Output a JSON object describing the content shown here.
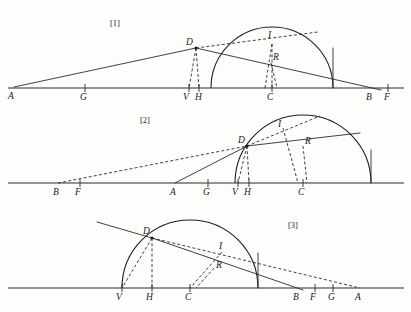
{
  "document": {
    "title": "Three refraction construction diagrams",
    "background_color": "#fdfdfb",
    "ink_color": "#2b2b2b"
  },
  "figures": [
    {
      "id": "figure-1",
      "caption": "[1]",
      "caption_x": 110,
      "caption_y": 26,
      "baseline": {
        "x1": 8,
        "y1": 88,
        "x2": 404,
        "y2": 88
      },
      "arc": {
        "cx": 272,
        "cy": 88,
        "r": 61,
        "start_deg": 180,
        "end_deg": 0
      },
      "points": [
        {
          "label": "A",
          "x": 14,
          "y": 87,
          "lx": 8,
          "ly": 99,
          "tick": false,
          "dot": false
        },
        {
          "label": "G",
          "x": 85,
          "y": 88,
          "lx": 80,
          "ly": 100,
          "tick": true,
          "dot": false
        },
        {
          "label": "V",
          "x": 189,
          "y": 88,
          "lx": 183,
          "ly": 100,
          "tick": true,
          "dot": false
        },
        {
          "label": "H",
          "x": 199,
          "y": 88,
          "lx": 195,
          "ly": 100,
          "tick": true,
          "dot": false
        },
        {
          "label": "C",
          "x": 272,
          "y": 88,
          "lx": 267,
          "ly": 100,
          "tick": true,
          "dot": false
        },
        {
          "label": "B",
          "x": 372,
          "y": 88,
          "lx": 366,
          "ly": 100,
          "tick": false,
          "dot": false
        },
        {
          "label": "F",
          "x": 388,
          "y": 88,
          "lx": 384,
          "ly": 100,
          "tick": true,
          "dot": false
        },
        {
          "label": "D",
          "x": 196,
          "y": 48,
          "lx": 186,
          "ly": 45,
          "tick": false,
          "dot": true
        },
        {
          "label": "I",
          "x": 272,
          "y": 44,
          "lx": 268,
          "ly": 38,
          "tick": false,
          "dot": false
        },
        {
          "label": "R",
          "x": 271,
          "y": 63,
          "lx": 273,
          "ly": 60,
          "tick": false,
          "dot": false
        }
      ],
      "solid_segments": [
        {
          "name": "incident-ray-A-D",
          "x1": 14,
          "y1": 87,
          "x2": 196,
          "y2": 48
        },
        {
          "name": "refracted-ray-D-B",
          "x1": 196,
          "y1": 48,
          "x2": 381,
          "y2": 90
        },
        {
          "name": "vertical-right-edge",
          "x1": 333,
          "y1": 88,
          "x2": 333,
          "y2": 48
        }
      ],
      "dashed_segments": [
        {
          "name": "chord-D-to-upper-right",
          "x1": 196,
          "y1": 48,
          "x2": 318,
          "y2": 32
        },
        {
          "name": "normal-D-to-V",
          "x1": 196,
          "y1": 48,
          "x2": 189,
          "y2": 88
        },
        {
          "name": "perp-D-to-H",
          "x1": 196,
          "y1": 48,
          "x2": 199,
          "y2": 88
        },
        {
          "name": "normal-I-to-C",
          "x1": 272,
          "y1": 44,
          "x2": 272,
          "y2": 88
        },
        {
          "name": "sine-I-drop",
          "x1": 272,
          "y1": 44,
          "x2": 265,
          "y2": 88
        },
        {
          "name": "sine-R-drop",
          "x1": 271,
          "y1": 63,
          "x2": 277,
          "y2": 88
        }
      ]
    },
    {
      "id": "figure-2",
      "caption": "[2]",
      "caption_x": 140,
      "caption_y": 123,
      "baseline": {
        "x1": 8,
        "y1": 183,
        "x2": 404,
        "y2": 183
      },
      "arc": {
        "cx": 303,
        "cy": 183,
        "r": 68,
        "start_deg": 180,
        "end_deg": 0
      },
      "points": [
        {
          "label": "B",
          "x": 58,
          "y": 183,
          "lx": 53,
          "ly": 195,
          "tick": false,
          "dot": false
        },
        {
          "label": "F",
          "x": 80,
          "y": 183,
          "lx": 75,
          "ly": 195,
          "tick": true,
          "dot": false
        },
        {
          "label": "A",
          "x": 175,
          "y": 183,
          "lx": 170,
          "ly": 195,
          "tick": false,
          "dot": false
        },
        {
          "label": "G",
          "x": 208,
          "y": 183,
          "lx": 203,
          "ly": 195,
          "tick": true,
          "dot": false
        },
        {
          "label": "V",
          "x": 238,
          "y": 183,
          "lx": 232,
          "ly": 195,
          "tick": true,
          "dot": false
        },
        {
          "label": "H",
          "x": 249,
          "y": 183,
          "lx": 244,
          "ly": 195,
          "tick": true,
          "dot": false
        },
        {
          "label": "C",
          "x": 303,
          "y": 183,
          "lx": 298,
          "ly": 195,
          "tick": true,
          "dot": false
        },
        {
          "label": "D",
          "x": 247,
          "y": 146,
          "lx": 238,
          "ly": 143,
          "tick": false,
          "dot": true
        },
        {
          "label": "I",
          "x": 283,
          "y": 128,
          "lx": 278,
          "ly": 127,
          "tick": false,
          "dot": false
        },
        {
          "label": "R",
          "x": 303,
          "y": 146,
          "lx": 305,
          "ly": 144,
          "tick": false,
          "dot": false
        }
      ],
      "solid_segments": [
        {
          "name": "incident-ray-A-D",
          "x1": 175,
          "y1": 183,
          "x2": 247,
          "y2": 146
        },
        {
          "name": "refracted-ray-D-right",
          "x1": 247,
          "y1": 146,
          "x2": 360,
          "y2": 133
        },
        {
          "name": "vertical-right-edge",
          "x1": 371,
          "y1": 183,
          "x2": 371,
          "y2": 150
        }
      ],
      "dashed_segments": [
        {
          "name": "extension-B-to-D",
          "x1": 58,
          "y1": 183,
          "x2": 247,
          "y2": 146
        },
        {
          "name": "chord-D-to-apex",
          "x1": 247,
          "y1": 146,
          "x2": 320,
          "y2": 116
        },
        {
          "name": "normal-D-to-V",
          "x1": 247,
          "y1": 146,
          "x2": 238,
          "y2": 183
        },
        {
          "name": "perp-D-to-H",
          "x1": 247,
          "y1": 146,
          "x2": 249,
          "y2": 183
        },
        {
          "name": "normal-I-to-C",
          "x1": 283,
          "y1": 128,
          "x2": 298,
          "y2": 183
        },
        {
          "name": "sine-R-drop",
          "x1": 303,
          "y1": 146,
          "x2": 307,
          "y2": 183
        }
      ]
    },
    {
      "id": "figure-3",
      "caption": "[3]",
      "caption_x": 288,
      "caption_y": 228,
      "baseline": {
        "x1": 8,
        "y1": 288,
        "x2": 404,
        "y2": 288
      },
      "arc": {
        "cx": 190,
        "cy": 288,
        "r": 68,
        "start_deg": 180,
        "end_deg": 0
      },
      "points": [
        {
          "label": "V",
          "x": 122,
          "y": 288,
          "lx": 116,
          "ly": 300,
          "tick": true,
          "dot": false
        },
        {
          "label": "H",
          "x": 152,
          "y": 288,
          "lx": 146,
          "ly": 300,
          "tick": true,
          "dot": false
        },
        {
          "label": "C",
          "x": 190,
          "y": 288,
          "lx": 185,
          "ly": 300,
          "tick": true,
          "dot": false
        },
        {
          "label": "B",
          "x": 298,
          "y": 288,
          "lx": 293,
          "ly": 300,
          "tick": false,
          "dot": false
        },
        {
          "label": "F",
          "x": 315,
          "y": 288,
          "lx": 310,
          "ly": 300,
          "tick": true,
          "dot": false
        },
        {
          "label": "G",
          "x": 333,
          "y": 288,
          "lx": 328,
          "ly": 300,
          "tick": true,
          "dot": false
        },
        {
          "label": "A",
          "x": 360,
          "y": 288,
          "lx": 355,
          "ly": 300,
          "tick": false,
          "dot": false
        },
        {
          "label": "D",
          "x": 152,
          "y": 238,
          "lx": 143,
          "ly": 234,
          "tick": false,
          "dot": true
        },
        {
          "label": "I",
          "x": 222,
          "y": 252,
          "lx": 219,
          "ly": 249,
          "tick": false,
          "dot": false
        },
        {
          "label": "R",
          "x": 214,
          "y": 268,
          "lx": 216,
          "ly": 268,
          "tick": false,
          "dot": false
        }
      ],
      "solid_segments": [
        {
          "name": "incident-ray-upper-left",
          "x1": 97,
          "y1": 222,
          "x2": 152,
          "y2": 238
        },
        {
          "name": "refracted-ray-D-B",
          "x1": 152,
          "y1": 238,
          "x2": 303,
          "y2": 290
        },
        {
          "name": "vertical-right-edge",
          "x1": 258,
          "y1": 288,
          "x2": 258,
          "y2": 253
        }
      ],
      "dashed_segments": [
        {
          "name": "extension-D-to-A",
          "x1": 152,
          "y1": 238,
          "x2": 360,
          "y2": 288
        },
        {
          "name": "normal-D-to-V",
          "x1": 152,
          "y1": 238,
          "x2": 122,
          "y2": 288
        },
        {
          "name": "perp-D-to-H",
          "x1": 152,
          "y1": 238,
          "x2": 152,
          "y2": 288
        },
        {
          "name": "normal-I-to-C",
          "x1": 222,
          "y1": 252,
          "x2": 190,
          "y2": 288
        },
        {
          "name": "sine-R-drop",
          "x1": 214,
          "y1": 268,
          "x2": 196,
          "y2": 288
        }
      ]
    }
  ]
}
